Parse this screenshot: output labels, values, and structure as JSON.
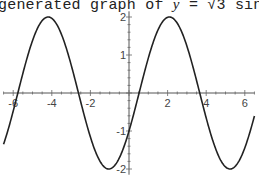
{
  "title": {
    "prefix": "generated graph of ",
    "y_var": "y",
    "eq": " = √3 sin ",
    "x_var": "x",
    "suffix": " −"
  },
  "chart_data": {
    "type": "line",
    "function": "y = sqrt(3) sin x - cos x",
    "xlabel": "",
    "ylabel": "",
    "xlim": [
      -6.5,
      6.5
    ],
    "ylim": [
      -2,
      2
    ],
    "x_ticks": [
      -6,
      -4,
      -2,
      2,
      4,
      6
    ],
    "y_ticks": [
      2,
      1,
      -1,
      -2
    ],
    "grid": false,
    "series": [
      {
        "name": "y",
        "x": [
          -6.5,
          -5.5,
          -4.5,
          -4.19,
          -3.5,
          -2.62,
          -1.5,
          -1.05,
          0,
          0.52,
          1.5,
          2.09,
          3,
          3.67,
          4.5,
          5.24,
          6,
          6.5
        ],
        "values": [
          -0.95,
          0.75,
          1.96,
          2.0,
          1.41,
          0.0,
          -1.66,
          -2.0,
          -1.0,
          0.0,
          1.66,
          2.0,
          1.23,
          0.0,
          -1.75,
          -2.0,
          -1.45,
          -0.64
        ]
      }
    ],
    "color": "#222222"
  }
}
